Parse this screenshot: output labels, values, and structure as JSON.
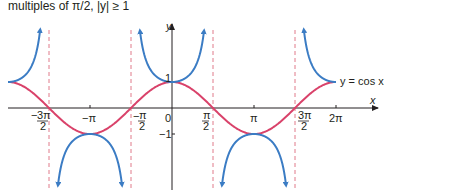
{
  "caption": "multiples of π/2, |y| ≥ 1",
  "chart_data": {
    "type": "line",
    "title": "",
    "xlabel": "x",
    "ylabel": "y",
    "xlim": [
      -6.283,
      6.283
    ],
    "ylim": [
      -3,
      3
    ],
    "x_ticks": [
      "-3π/2",
      "-π",
      "-π/2",
      "0",
      "π/2",
      "π",
      "3π/2",
      "2π"
    ],
    "y_ticks": [
      "1",
      "-1"
    ],
    "asymptotes": [
      "-3π/2",
      "-π/2",
      "π/2",
      "3π/2"
    ],
    "series": [
      {
        "name": "y = cos x",
        "color": "#d9426a",
        "function": "cos(x)",
        "domain": [
          -6.283,
          6.283
        ]
      },
      {
        "name": "y = sec x",
        "color": "#3b7cc4",
        "function": "sec(x)",
        "domain": [
          -6.283,
          6.283
        ]
      }
    ],
    "annotations": [
      "y = cos x"
    ],
    "grid": false
  },
  "labels": {
    "x_axis": "x",
    "y_axis": "y",
    "cos_label": "y = cos x",
    "tick_neg_3pi_2_num": "3π",
    "tick_neg_3pi_2_den": "2",
    "tick_neg_pi": "−π",
    "tick_neg_pi_2_num": "π",
    "tick_neg_pi_2_den": "2",
    "tick_zero": "0",
    "tick_pi_2_num": "π",
    "tick_pi_2_den": "2",
    "tick_pi": "π",
    "tick_3pi_2_num": "3π",
    "tick_3pi_2_den": "2",
    "tick_2pi": "2π",
    "y_one": "1",
    "y_neg_one": "−1",
    "minus": "−"
  }
}
